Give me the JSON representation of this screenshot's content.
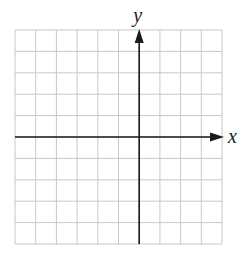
{
  "chart_data": {
    "type": "line",
    "title": "",
    "xlabel": "x",
    "ylabel": "y",
    "grid": true,
    "grid_columns": 10,
    "grid_rows": 10,
    "origin_column": 6,
    "origin_row": 5,
    "xlim": [
      -6,
      4
    ],
    "ylim": [
      -5,
      5
    ],
    "series": [],
    "tick_labels": false
  },
  "axes": {
    "x_label": "x",
    "y_label": "y"
  },
  "colors": {
    "grid": "#c8c8c8",
    "axis": "#1a1a1a",
    "background": "#ffffff"
  }
}
